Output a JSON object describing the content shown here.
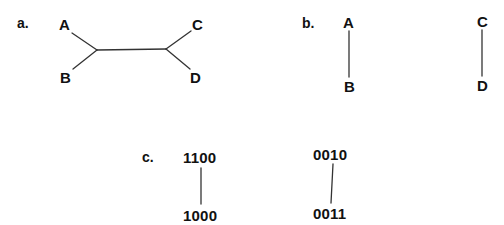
{
  "panels": {
    "a": {
      "label": "a.",
      "description": "unrooted tree with internal edge",
      "nodes": {
        "A": {
          "label": "A"
        },
        "B": {
          "label": "B"
        },
        "C": {
          "label": "C"
        },
        "D": {
          "label": "D"
        }
      },
      "edges": [
        [
          "A",
          "junction1"
        ],
        [
          "B",
          "junction1"
        ],
        [
          "junction1",
          "junction2"
        ],
        [
          "C",
          "junction2"
        ],
        [
          "D",
          "junction2"
        ]
      ]
    },
    "b": {
      "label": "b.",
      "description": "two separate pairs",
      "nodes": {
        "A": {
          "label": "A"
        },
        "B": {
          "label": "B"
        },
        "C": {
          "label": "C"
        },
        "D": {
          "label": "D"
        }
      },
      "edges": [
        [
          "A",
          "B"
        ],
        [
          "C",
          "D"
        ]
      ]
    },
    "c": {
      "label": "c.",
      "description": "binary codes connected in pairs",
      "nodes": {
        "n1": {
          "label": "1100"
        },
        "n2": {
          "label": "1000"
        },
        "n3": {
          "label": "0010"
        },
        "n4": {
          "label": "0011"
        }
      },
      "edges": [
        [
          "n1",
          "n2"
        ],
        [
          "n3",
          "n4"
        ]
      ]
    }
  },
  "colors": {
    "ink": "#111111",
    "line": "#333333",
    "background": "#ffffff"
  }
}
